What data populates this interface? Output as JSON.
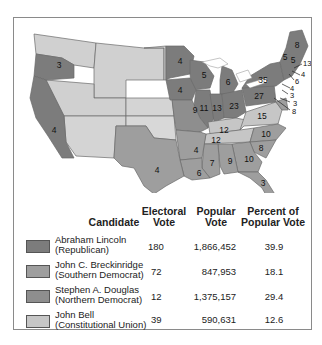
{
  "colors": {
    "lincoln": "#7c7c7c",
    "breckinridge": "#9e9e9e",
    "douglas": "#8e8e8e",
    "bell": "#c6c6c6",
    "unorganized": "#d4d4d4"
  },
  "map": {
    "state_labels": [
      {
        "state": "Oregon",
        "votes": "3",
        "candidate": "lincoln"
      },
      {
        "state": "California",
        "votes": "4",
        "candidate": "lincoln"
      },
      {
        "state": "Minnesota",
        "votes": "4",
        "candidate": "lincoln"
      },
      {
        "state": "Wisconsin",
        "votes": "5",
        "candidate": "lincoln"
      },
      {
        "state": "Michigan",
        "votes": "6",
        "candidate": "lincoln"
      },
      {
        "state": "Iowa",
        "votes": "4",
        "candidate": "lincoln"
      },
      {
        "state": "Illinois",
        "votes": "11",
        "candidate": "lincoln"
      },
      {
        "state": "Indiana",
        "votes": "13",
        "candidate": "lincoln"
      },
      {
        "state": "Ohio",
        "votes": "23",
        "candidate": "lincoln"
      },
      {
        "state": "Pennsylvania",
        "votes": "27",
        "candidate": "lincoln"
      },
      {
        "state": "New York",
        "votes": "35",
        "candidate": "lincoln"
      },
      {
        "state": "Maine",
        "votes": "8",
        "candidate": "lincoln"
      },
      {
        "state": "Vermont",
        "votes": "5",
        "candidate": "lincoln"
      },
      {
        "state": "New Hampshire",
        "votes": "5",
        "candidate": "lincoln"
      },
      {
        "state": "Massachusetts",
        "votes": "13",
        "candidate": "lincoln"
      },
      {
        "state": "Rhode Island",
        "votes": "4",
        "candidate": "lincoln"
      },
      {
        "state": "Connecticut",
        "votes": "6",
        "candidate": "lincoln"
      },
      {
        "state": "New Jersey",
        "votes": "4",
        "candidate": "lincoln"
      },
      {
        "state": "Delaware",
        "votes": "3",
        "candidate": "breckinridge"
      },
      {
        "state": "Delaware-2",
        "votes": "3",
        "candidate": "breckinridge"
      },
      {
        "state": "Maryland",
        "votes": "8",
        "candidate": "breckinridge"
      },
      {
        "state": "Missouri",
        "votes": "9",
        "candidate": "douglas"
      },
      {
        "state": "Kentucky",
        "votes": "12",
        "candidate": "bell"
      },
      {
        "state": "Virginia",
        "votes": "15",
        "candidate": "bell"
      },
      {
        "state": "Tennessee",
        "votes": "12",
        "candidate": "bell"
      },
      {
        "state": "North Carolina",
        "votes": "10",
        "candidate": "breckinridge"
      },
      {
        "state": "South Carolina",
        "votes": "8",
        "candidate": "breckinridge"
      },
      {
        "state": "Georgia",
        "votes": "10",
        "candidate": "breckinridge"
      },
      {
        "state": "Alabama",
        "votes": "9",
        "candidate": "breckinridge"
      },
      {
        "state": "Mississippi",
        "votes": "7",
        "candidate": "breckinridge"
      },
      {
        "state": "Louisiana",
        "votes": "6",
        "candidate": "breckinridge"
      },
      {
        "state": "Arkansas",
        "votes": "4",
        "candidate": "breckinridge"
      },
      {
        "state": "Texas",
        "votes": "4",
        "candidate": "breckinridge"
      },
      {
        "state": "Florida",
        "votes": "3",
        "candidate": "breckinridge"
      }
    ]
  },
  "legend": {
    "headers": {
      "candidate": "Candidate",
      "electoral_1": "Electoral",
      "electoral_2": "Vote",
      "popular_1": "Popular",
      "popular_2": "Vote",
      "percent_1": "Percent of",
      "percent_2": "Popular Vote"
    },
    "rows": [
      {
        "name": "Abraham Lincoln",
        "party": "(Republican)",
        "electoral": "180",
        "popular": "1,866,452",
        "percent": "39.9"
      },
      {
        "name": "John C. Breckinridge",
        "party": "(Southern Democrat)",
        "electoral": "72",
        "popular": "847,953",
        "percent": "18.1"
      },
      {
        "name": "Stephen A. Douglas",
        "party": "(Northern Democrat)",
        "electoral": "12",
        "popular": "1,375,157",
        "percent": "29.4"
      },
      {
        "name": "John Bell",
        "party": "(Constitutional Union)",
        "electoral": "39",
        "popular": "590,631",
        "percent": "12.6"
      }
    ]
  }
}
